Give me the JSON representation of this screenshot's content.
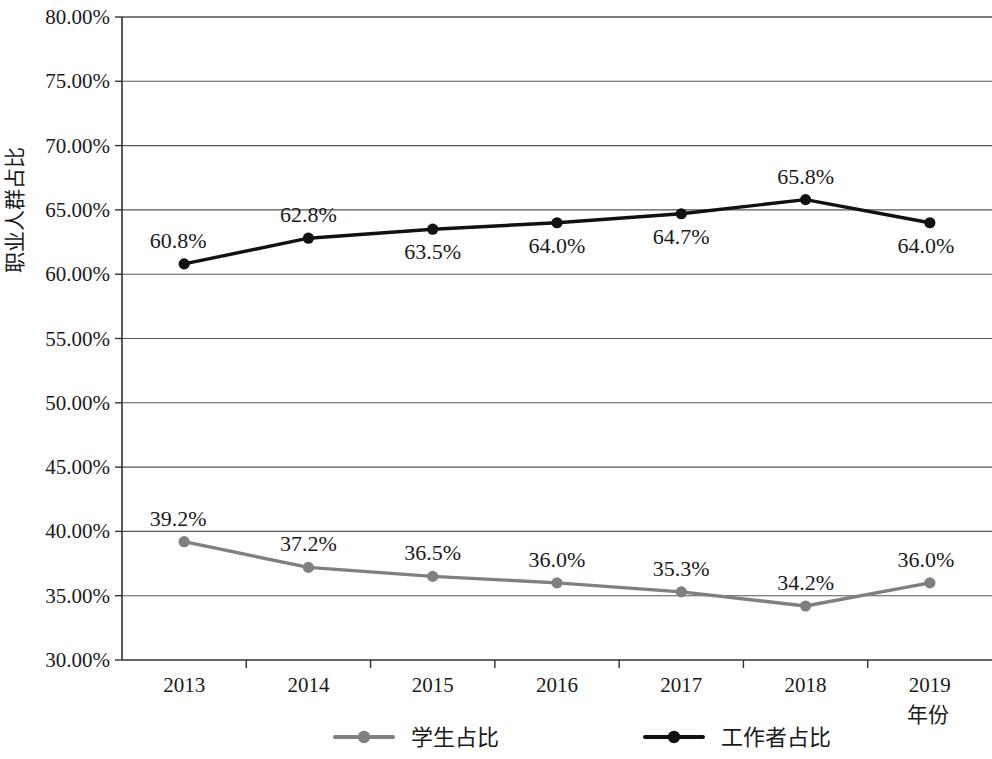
{
  "chart_data": {
    "type": "line",
    "title": "",
    "xlabel": "年份",
    "ylabel": "职业人群占比",
    "categories": [
      "2013",
      "2014",
      "2015",
      "2016",
      "2017",
      "2018",
      "2019"
    ],
    "ylim": [
      30,
      80
    ],
    "ytick_step": 5,
    "ytick_labels": [
      "30.00%",
      "35.00%",
      "40.00%",
      "45.00%",
      "50.00%",
      "55.00%",
      "60.00%",
      "65.00%",
      "70.00%",
      "75.00%",
      "80.00%"
    ],
    "ytick_values": [
      30,
      35,
      40,
      45,
      50,
      55,
      60,
      65,
      70,
      75,
      80
    ],
    "grid": true,
    "legend_position": "bottom",
    "series": [
      {
        "name": "学生占比",
        "color": "#808080",
        "marker": "circle",
        "values": [
          39.2,
          37.2,
          36.5,
          36.0,
          35.3,
          34.2,
          36.0
        ],
        "labels": [
          "39.2%",
          "37.2%",
          "36.5%",
          "36.0%",
          "35.3%",
          "34.2%",
          "36.0%"
        ],
        "label_positions": [
          "above",
          "above",
          "above",
          "above",
          "above",
          "above",
          "above"
        ]
      },
      {
        "name": "工作者占比",
        "color": "#111111",
        "marker": "circle",
        "values": [
          60.8,
          62.8,
          63.5,
          64.0,
          64.7,
          65.8,
          64.0
        ],
        "labels": [
          "60.8%",
          "62.8%",
          "63.5%",
          "64.0%",
          "64.7%",
          "65.8%",
          "64.0%"
        ],
        "label_positions": [
          "above",
          "above",
          "below",
          "below",
          "below",
          "above",
          "below"
        ]
      }
    ]
  },
  "legend": {
    "items": [
      {
        "label": "学生占比",
        "color": "#808080"
      },
      {
        "label": "工作者占比",
        "color": "#111111"
      }
    ]
  },
  "axes": {
    "y_title": "职业人群占比",
    "x_title": "年份"
  }
}
